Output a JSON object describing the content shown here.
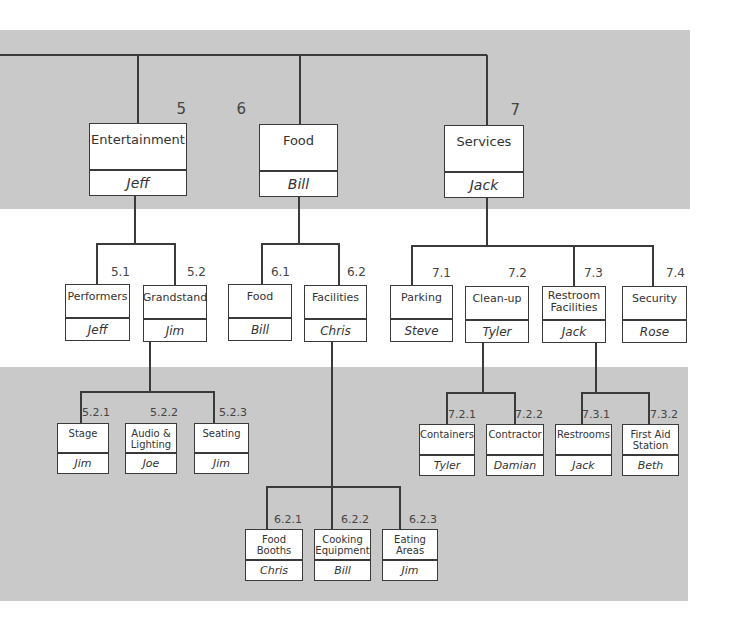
{
  "diagram": {
    "type": "work-breakdown-structure",
    "nodes": [
      {
        "id": "5",
        "title": "Entertainment",
        "owner": "Jeff",
        "level": 1
      },
      {
        "id": "6",
        "title": "Food",
        "owner": "Bill",
        "level": 1
      },
      {
        "id": "7",
        "title": "Services",
        "owner": "Jack",
        "level": 1
      },
      {
        "id": "5.1",
        "title": "Performers",
        "owner": "Jeff",
        "level": 2
      },
      {
        "id": "5.2",
        "title": "Grandstand",
        "owner": "Jim",
        "level": 2
      },
      {
        "id": "6.1",
        "title": "Food",
        "owner": "Bill",
        "level": 2
      },
      {
        "id": "6.2",
        "title": "Facilities",
        "owner": "Chris",
        "level": 2
      },
      {
        "id": "7.1",
        "title": "Parking",
        "owner": "Steve",
        "level": 2
      },
      {
        "id": "7.2",
        "title": "Clean-up",
        "owner": "Tyler",
        "level": 2
      },
      {
        "id": "7.3",
        "title": "Restroom Facilities",
        "owner": "Jack",
        "level": 2
      },
      {
        "id": "7.4",
        "title": "Security",
        "owner": "Rose",
        "level": 2
      },
      {
        "id": "5.2.1",
        "title": "Stage",
        "owner": "Jim",
        "level": 3
      },
      {
        "id": "5.2.2",
        "title": "Audio & Lighting",
        "owner": "Joe",
        "level": 3
      },
      {
        "id": "5.2.3",
        "title": "Seating",
        "owner": "Jim",
        "level": 3
      },
      {
        "id": "7.2.1",
        "title": "Containers",
        "owner": "Tyler",
        "level": 3
      },
      {
        "id": "7.2.2",
        "title": "Contractor",
        "owner": "Damian",
        "level": 3
      },
      {
        "id": "7.3.1",
        "title": "Restrooms",
        "owner": "Jack",
        "level": 3
      },
      {
        "id": "7.3.2",
        "title": "First Aid Station",
        "owner": "Beth",
        "level": 3
      },
      {
        "id": "6.2.1",
        "title": "Food Booths",
        "owner": "Chris",
        "level": 4
      },
      {
        "id": "6.2.2",
        "title": "Cooking Equipment",
        "owner": "Bill",
        "level": 4
      },
      {
        "id": "6.2.3",
        "title": "Eating Areas",
        "owner": "Jim",
        "level": 4
      }
    ]
  },
  "colors": {
    "band": "#c9c9c9",
    "line": "#3a3a3a",
    "box": "#ffffff"
  }
}
